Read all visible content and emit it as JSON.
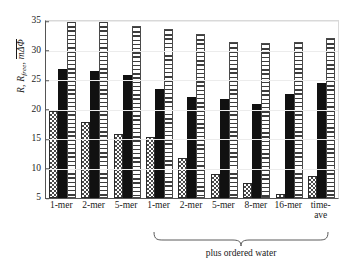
{
  "chart_data": {
    "type": "bar",
    "title": "",
    "xlabel": "",
    "ylabel": "R, R_free, |mΔΦ|",
    "ylabel_parts": {
      "r": "R",
      "rfree_base": "R",
      "rfree_sub": "free",
      "abs_term": "mΔΦ"
    },
    "categories": [
      "1-mer",
      "2-mer",
      "5-mer",
      "1-mer",
      "2-mer",
      "5-mer",
      "8-mer",
      "16-mer",
      "time-\nave"
    ],
    "ylim": [
      5,
      35
    ],
    "yticks": [
      5,
      10,
      15,
      20,
      25,
      30,
      35
    ],
    "grid": false,
    "legend": "none",
    "series": [
      {
        "name": "R",
        "pattern": "checkered",
        "values": [
          19.7,
          17.8,
          15.8,
          15.4,
          11.8,
          9.1,
          7.5,
          5.6,
          8.8
        ]
      },
      {
        "name": "R_free",
        "pattern": "solid-black",
        "values": [
          26.8,
          26.5,
          25.9,
          23.4,
          22.1,
          21.8,
          21.0,
          22.7,
          24.5
        ]
      },
      {
        "name": "|mΔΦ|",
        "pattern": "horizontal-stripes",
        "values": [
          35.0,
          35.0,
          34.2,
          33.7,
          32.8,
          31.4,
          31.3,
          31.5,
          32.2
        ]
      }
    ],
    "annotations": [
      {
        "text": "plus ordered water",
        "spans_categories": [
          3,
          4,
          5,
          6,
          7,
          8
        ],
        "marker": "curly-brace"
      }
    ]
  }
}
